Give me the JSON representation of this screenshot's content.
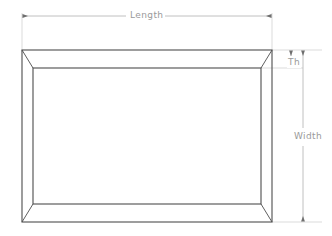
{
  "drawing": {
    "title": "Rectangular frame dimension diagram",
    "type": "technical-line-drawing",
    "line_color": "#4d4d4d",
    "dimension_color": "#b3b3b3",
    "text_color": "#9a9a9a",
    "background_color": "#ffffff",
    "frame": {
      "outer": {
        "left": 22,
        "top": 50,
        "right": 272,
        "bottom": 222
      },
      "inner": {
        "left": 33,
        "top": 68,
        "right": 261,
        "bottom": 204
      },
      "corner_joint": "mitered"
    }
  },
  "dimensions": {
    "length": {
      "label": "Length",
      "orientation": "horizontal",
      "position": "top",
      "arrows": "both-ends"
    },
    "thickness": {
      "label": "Th",
      "orientation": "vertical",
      "position": "top-right",
      "arrows": "both-ends"
    },
    "width": {
      "label": "Width",
      "orientation": "vertical",
      "position": "right",
      "arrows": "both-ends"
    }
  }
}
